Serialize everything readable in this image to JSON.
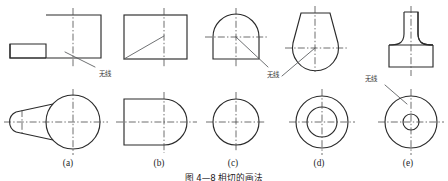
{
  "figure": {
    "caption": "图 4—8  相切的画法",
    "caption_visible": "partially-cropped",
    "background_color": "#ffffff",
    "line_color": "#2b2b2b",
    "center_line_color": "#4a4a4a",
    "leader_color": "#55575a",
    "annotation_text_color": "#3a3a3a"
  },
  "annotations": {
    "label_a": "无线",
    "label_c": "无线",
    "label_e": "无线"
  },
  "views": [
    {
      "key": "a",
      "label": "(a)",
      "front_description": "rectangle with small left tab",
      "top_description": "large circle tangent to cone tapering to small circle at left",
      "annotation": "无线"
    },
    {
      "key": "b",
      "label": "(b)",
      "front_description": "plain rectangle",
      "top_description": "rectangle with semicircular right end",
      "annotation": ""
    },
    {
      "key": "c",
      "label": "(c)",
      "front_description": "rectangle with semicircular dome top",
      "top_description": "single circle",
      "annotation": "无线"
    },
    {
      "key": "d",
      "label": "(d)",
      "front_description": "pear shaped outline, flat top, round bottom",
      "top_description": "two concentric circles",
      "annotation": ""
    },
    {
      "key": "e",
      "label": "(e)",
      "front_description": "T shaped part with filleted transitions",
      "top_description": "large circle with small concentric circle",
      "annotation": "无线"
    }
  ]
}
